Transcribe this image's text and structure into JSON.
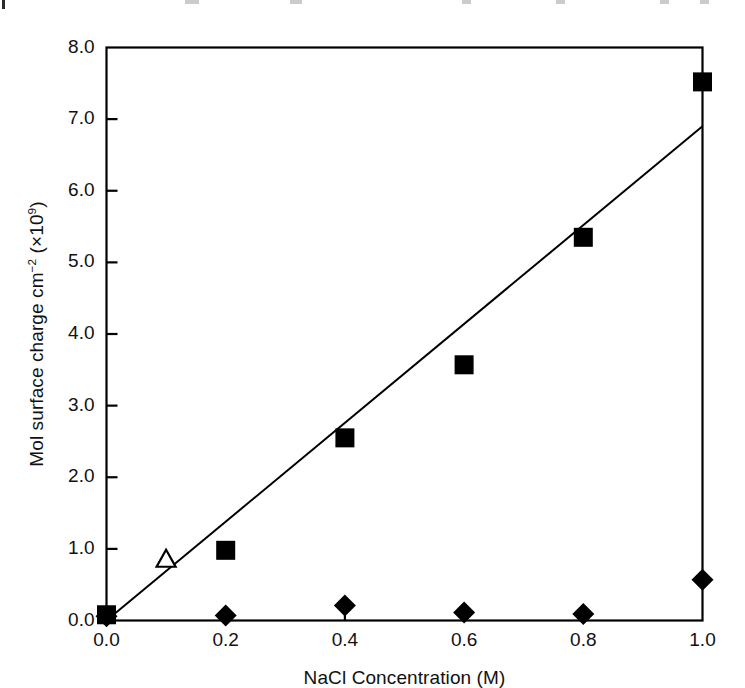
{
  "figure": {
    "background_color": "#ffffff",
    "ink_color": "#000000"
  },
  "top_bleed": {
    "description": "cropped-text-fragment"
  },
  "axes": {
    "x_title": "NaCl Concentration (M)",
    "y_title_main": "Mol surface charge cm",
    "y_title_exp1": "−2",
    "y_title_mid": " (×10",
    "y_title_exp2": "9",
    "y_title_end": ")",
    "x_tick_labels": [
      "0.0",
      "0.2",
      "0.4",
      "0.6",
      "0.8",
      "1.0"
    ],
    "y_tick_labels": [
      "0.0",
      "1.0",
      "2.0",
      "3.0",
      "4.0",
      "5.0",
      "6.0",
      "7.0",
      "8.0"
    ]
  },
  "chart_data": {
    "type": "scatter",
    "title": "",
    "subtitle": "",
    "xlabel": "NaCl Concentration (M)",
    "ylabel": "Mol surface charge cm^-2 (×10^9)",
    "xlim": [
      0.0,
      1.0
    ],
    "ylim": [
      0.0,
      8.0
    ],
    "xticks": [
      0.0,
      0.2,
      0.4,
      0.6,
      0.8,
      1.0
    ],
    "yticks": [
      0.0,
      1.0,
      2.0,
      3.0,
      4.0,
      5.0,
      6.0,
      7.0,
      8.0
    ],
    "grid": false,
    "legend": "none",
    "tick_direction": "inward",
    "frame": "box",
    "series": [
      {
        "name": "filled-square-series",
        "marker": "filled-square",
        "color": "#000000",
        "points": [
          {
            "x": 0.0,
            "y": 0.08
          },
          {
            "x": 0.2,
            "y": 0.98
          },
          {
            "x": 0.4,
            "y": 2.55
          },
          {
            "x": 0.6,
            "y": 3.57
          },
          {
            "x": 0.8,
            "y": 5.35
          },
          {
            "x": 1.0,
            "y": 7.52
          }
        ]
      },
      {
        "name": "open-triangle-series",
        "marker": "open-triangle",
        "color": "#000000",
        "points": [
          {
            "x": 0.1,
            "y": 0.85
          }
        ]
      },
      {
        "name": "filled-diamond-series",
        "marker": "filled-diamond",
        "color": "#000000",
        "points": [
          {
            "x": 0.0,
            "y": 0.06
          },
          {
            "x": 0.2,
            "y": 0.07
          },
          {
            "x": 0.4,
            "y": 0.21
          },
          {
            "x": 0.6,
            "y": 0.11
          },
          {
            "x": 0.8,
            "y": 0.09
          },
          {
            "x": 1.0,
            "y": 0.57
          }
        ]
      }
    ],
    "trend_line": {
      "name": "linear-fit-line",
      "color": "#000000",
      "from": {
        "x": 0.0,
        "y": 0.0
      },
      "to": {
        "x": 1.0,
        "y": 6.9
      }
    }
  }
}
